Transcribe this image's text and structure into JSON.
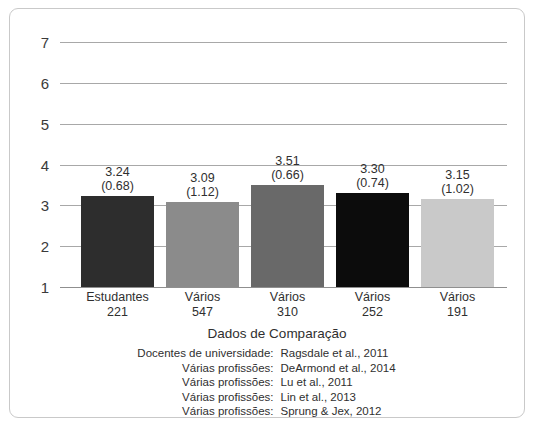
{
  "chart_data": {
    "type": "bar",
    "title": "Dados de Comparação",
    "xlabel": "",
    "ylabel": "",
    "ylim": [
      1,
      7
    ],
    "yticks": [
      1,
      2,
      3,
      4,
      5,
      6,
      7
    ],
    "grid": true,
    "legend_position": "below-axis",
    "categories": [
      "Estudantes",
      "Vários",
      "Vários",
      "Vários",
      "Vários"
    ],
    "sample_sizes": [
      221,
      547,
      310,
      252,
      191
    ],
    "values": [
      3.24,
      3.09,
      3.51,
      3.3,
      3.15
    ],
    "std_devs": [
      0.68,
      1.12,
      0.66,
      0.74,
      1.02
    ],
    "value_labels": [
      "3.24",
      "3.09",
      "3.51",
      "3.30",
      "3.15"
    ],
    "sd_labels": [
      "(0.68)",
      "(1.12)",
      "(0.66)",
      "(0.74)",
      "(1.02)"
    ],
    "bar_colors": [
      "#2d2d2d",
      "#8b8b8b",
      "#696969",
      "#0c0c0c",
      "#c9c9c9"
    ],
    "bars": [
      {
        "category": "Estudantes",
        "sample_size": "221",
        "value": 3.24,
        "value_label": "3.24",
        "sd_label": "(0.68)",
        "color": "#2d2d2d"
      },
      {
        "category": "Vários",
        "sample_size": "547",
        "value": 3.09,
        "value_label": "3.09",
        "sd_label": "(1.12)",
        "color": "#8b8b8b"
      },
      {
        "category": "Vários",
        "sample_size": "310",
        "value": 3.51,
        "value_label": "3.51",
        "sd_label": "(0.66)",
        "color": "#696969"
      },
      {
        "category": "Vários",
        "sample_size": "252",
        "value": 3.3,
        "value_label": "3.30",
        "sd_label": "(0.74)",
        "color": "#0c0c0c"
      },
      {
        "category": "Vários",
        "sample_size": "191",
        "value": 3.15,
        "value_label": "3.15",
        "sd_label": "(1.02)",
        "color": "#c9c9c9"
      }
    ],
    "legend": [
      {
        "who": "Docentes de universidade:",
        "cite": "Ragsdale et al., 2011"
      },
      {
        "who": "Várias profissões:",
        "cite": "DeArmond et al., 2014"
      },
      {
        "who": "Várias profissões:",
        "cite": "Lu et al., 2011"
      },
      {
        "who": "Várias profissões:",
        "cite": "Lin et al., 2013"
      },
      {
        "who": "Várias profissões:",
        "cite": "Sprung & Jex, 2012"
      }
    ]
  },
  "yaxis": {
    "ticks": [
      "7",
      "6",
      "5",
      "4",
      "3",
      "2",
      "1"
    ]
  },
  "caption": {
    "text": ""
  },
  "colors": {
    "gridline": "#a8a8a8",
    "frame_border": "#c9c9c9",
    "text": "#2f2f2f",
    "background": "#ffffff"
  }
}
